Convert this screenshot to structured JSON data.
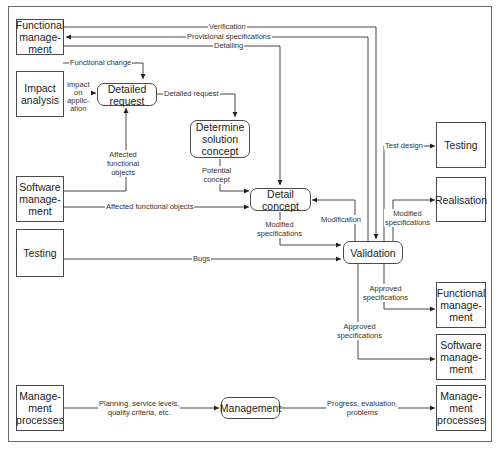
{
  "nodes": {
    "functional_management_src": "Functional\nmanage-\nment",
    "impact_analysis": "Impact\nanalysis",
    "detailed_request": "Detailed\nrequest",
    "determine_solution_concept": "Determine\nsolution\nconcept",
    "software_management_src": "Software\nmanage-\nment",
    "detail_concept": "Detail\nconcept",
    "testing_src": "Testing",
    "validation": "Validation",
    "testing_dst": "Testing",
    "realisation": "Realisation",
    "functional_management_dst": "Functional\nmanage-\nment",
    "software_management_dst": "Software\nmanage-\nment",
    "management_processes_src": "Manage-\nment\nprocesses",
    "management": "Management",
    "management_processes_dst": "Manage-\nment\nprocesses"
  },
  "edges": {
    "verification": "Verification",
    "provisional_specifications": "Provisional specifications",
    "detailing": "Detailing",
    "functional_change": "Functional change",
    "impact_on_application": "Impact\non\napplic-\nation",
    "detailed_request": "Detailed request",
    "affected_functional_objects_up": "Affected\nfunctional\nobjects",
    "potential_concept": "Potential\nconcept",
    "affected_functional_objects": "Affected functional objects",
    "modification": "Modification",
    "modified_specifications_detail": "Modified\nspecifications",
    "test_design": "Test design",
    "modified_specifications_real": "Modified\nspecifications",
    "bugs": "Bugs",
    "approved_specifications_fm": "Approved\nspecifications",
    "approved_specifications_sm": "Approved\nspecifications",
    "planning": "Planning, service levels,\nquality criteria, etc.",
    "progress": "Progress, evaluation,\nproblems"
  }
}
